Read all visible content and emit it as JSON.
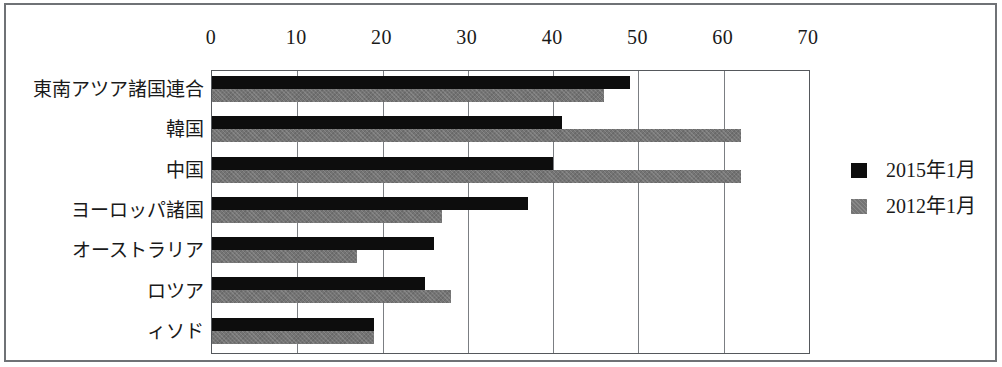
{
  "chart_data": {
    "type": "bar",
    "orientation": "horizontal",
    "title": "",
    "subtitle": "",
    "xlabel": "",
    "ylabel": "",
    "xlim": [
      0,
      70
    ],
    "xticks": [
      0,
      10,
      20,
      30,
      40,
      50,
      60,
      70
    ],
    "xtick_labels": [
      "0",
      "10",
      "20",
      "30",
      "40",
      "50",
      "60",
      "70"
    ],
    "grid": true,
    "grid_axis": "x",
    "legend_position": "right",
    "categories": [
      "東南アツア諸国連合",
      "韓国",
      "中国",
      "ヨーロッパ諸国",
      "オーストラリア",
      "ロツア",
      "ィソド"
    ],
    "series": [
      {
        "name": "2015年1月",
        "color": "#0d0d0d",
        "values": [
          49,
          41,
          40,
          37,
          26,
          25,
          19
        ]
      },
      {
        "name": "2012年1月",
        "color": "#747474",
        "values": [
          46,
          62,
          62,
          27,
          17,
          28,
          19
        ]
      }
    ],
    "annotations": []
  },
  "legend": {
    "entries": [
      {
        "label": "2015年1月",
        "swatch": "black-square-swatch"
      },
      {
        "label": "2012年1月",
        "swatch": "gray-square-swatch"
      }
    ]
  },
  "colors": {
    "series_2015": "#0d0d0d",
    "series_2012": "#747474",
    "gridline": "#7b7e82",
    "axis": "#55585c",
    "frame": "#6f7276",
    "background": "#ffffff",
    "text": "#1a1a1a"
  }
}
